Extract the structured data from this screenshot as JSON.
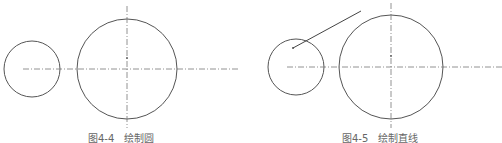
{
  "figures": [
    {
      "caption_number": "图4-4",
      "caption_title": "绘制圆",
      "small_circle": {
        "cx": 32,
        "cy": 69,
        "r": 28
      },
      "large_circle": {
        "cx": 127,
        "cy": 69,
        "r": 50
      }
    },
    {
      "caption_number": "图4-5",
      "caption_title": "绘制直线",
      "small_circle": {
        "cx": 296,
        "cy": 67,
        "r": 28
      },
      "large_circle": {
        "cx": 391,
        "cy": 67,
        "r": 52
      },
      "line": {
        "x1": 293,
        "y1": 48,
        "x2": 361,
        "y2": 11
      }
    }
  ],
  "colors": {
    "stroke": "#555555",
    "centerline": "#777777",
    "caption": "#666666"
  }
}
